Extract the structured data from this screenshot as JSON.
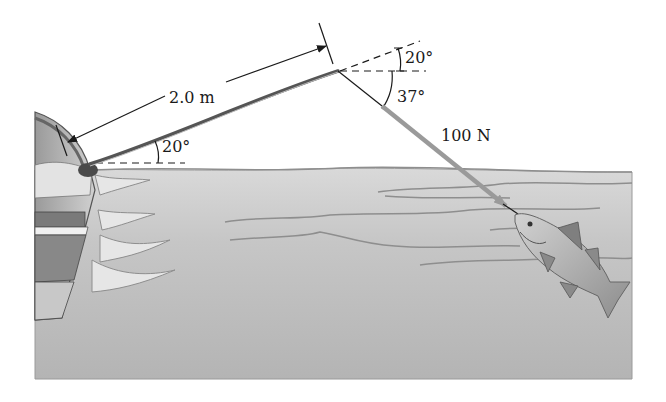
{
  "figure": {
    "labels": {
      "rod_length": "2.0 m",
      "rod_angle": "20°",
      "tip_angle_upper": "20°",
      "tip_angle_lower": "37°",
      "force": "100 N"
    },
    "colors": {
      "water": "#b9b9b9",
      "water_light": "#d6d6d6",
      "wave_line": "#8e8e8e",
      "force_arrow": "#9a9a9a",
      "ink": "#1a1a1a",
      "background": "#ffffff"
    },
    "values": {
      "rod_length_m": 2.0,
      "rod_angle_deg": 20,
      "line_angle_below_horizontal_deg": 37,
      "force_N": 100
    }
  }
}
